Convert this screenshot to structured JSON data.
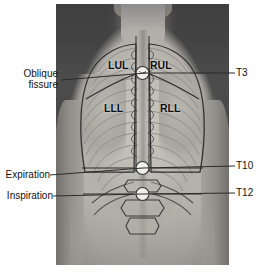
{
  "figure": {
    "media_type": "grayscale-photograph-with-line-overlay"
  },
  "lobe_labels": [
    {
      "id": "lul",
      "text": "LUL",
      "meaning": "left upper lobe",
      "x": 110,
      "y": 60
    },
    {
      "id": "rul",
      "text": "RUL",
      "meaning": "right upper lobe",
      "x": 152,
      "y": 60
    },
    {
      "id": "lll",
      "text": "LLL",
      "meaning": "left lower lobe",
      "x": 106,
      "y": 103
    },
    {
      "id": "rll",
      "text": "RLL",
      "meaning": "right lower lobe",
      "x": 162,
      "y": 103
    }
  ],
  "left_labels": [
    {
      "id": "oblique-fissure",
      "line1": "Oblique",
      "line2": "fissure",
      "text": "Oblique fissure",
      "x": 8,
      "y": 70
    },
    {
      "id": "expiration",
      "line1": "Expiration",
      "line2": "",
      "text": "Expiration",
      "x": 6,
      "y": 170
    },
    {
      "id": "inspiration",
      "line1": "Inspiration",
      "line2": "",
      "text": "Inspiration",
      "x": 6,
      "y": 191
    }
  ],
  "right_labels": [
    {
      "id": "t3",
      "text": "T3",
      "meaning": "third thoracic vertebra",
      "x": 238,
      "y": 70
    },
    {
      "id": "t10",
      "text": "T10",
      "meaning": "tenth thoracic vertebra",
      "x": 238,
      "y": 163
    },
    {
      "id": "t12",
      "text": "T12",
      "meaning": "twelfth thoracic vertebra",
      "x": 238,
      "y": 190
    }
  ],
  "colors": {
    "label_text": "#111111",
    "leader_line": "#2b2b2b",
    "overlay_line": "#3a3a3a",
    "rib_line": "#8d8d8d",
    "page_background": "#ffffff",
    "photo_background": "#4a4a4a"
  },
  "geometry": {
    "photo": {
      "x": 56,
      "y": 4,
      "width": 173,
      "height": 261
    },
    "canvas": {
      "width": 259,
      "height": 275
    }
  }
}
